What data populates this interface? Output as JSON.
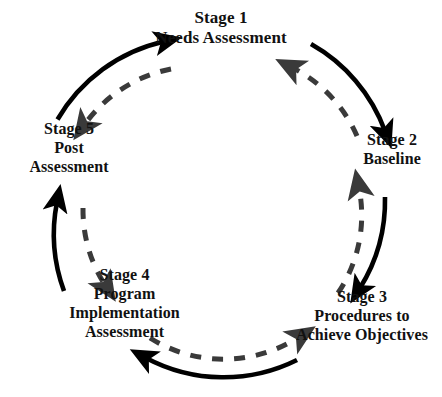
{
  "diagram": {
    "type": "circular-cycle",
    "center": {
      "x": 221,
      "y": 200
    },
    "solid_radius": 165,
    "dashed_radius": 139,
    "colors": {
      "background": "#ffffff",
      "solid_arc": "#000000",
      "dashed_arc": "#3a3a3a",
      "text": "#111111"
    },
    "stages": [
      {
        "id": "stage-1",
        "number": "Stage 1",
        "lines": [
          "Stage 1",
          "Needs Assessment"
        ],
        "angle_deg": -90
      },
      {
        "id": "stage-2",
        "number": "Stage 2",
        "lines": [
          "Stage 2",
          "Baseline"
        ],
        "angle_deg": -18
      },
      {
        "id": "stage-3",
        "number": "Stage 3",
        "lines": [
          "Stage 3",
          "Procedures to",
          "Achieve Objectives"
        ],
        "angle_deg": 54
      },
      {
        "id": "stage-4",
        "number": "Stage 4",
        "lines": [
          "Stage 4",
          "Program",
          "Implementation",
          "Assessment"
        ],
        "angle_deg": 126
      },
      {
        "id": "stage-5",
        "number": "Stage 5",
        "lines": [
          "Stage 5",
          "Post",
          "Assessment"
        ],
        "angle_deg": 198
      }
    ],
    "solid_arrows": [
      {
        "id": "arrow-solid-5-to-1",
        "from": "stage-5",
        "to": "stage-1",
        "style": "solid",
        "direction": "clockwise"
      },
      {
        "id": "arrow-solid-1-to-2",
        "from": "stage-1",
        "to": "stage-2",
        "style": "solid",
        "direction": "clockwise"
      },
      {
        "id": "arrow-solid-2-to-3",
        "from": "stage-2",
        "to": "stage-3",
        "style": "solid",
        "direction": "clockwise"
      },
      {
        "id": "arrow-solid-3-to-4",
        "from": "stage-3",
        "to": "stage-4",
        "style": "solid",
        "direction": "clockwise"
      },
      {
        "id": "arrow-solid-4-to-5",
        "from": "stage-4",
        "to": "stage-5",
        "style": "solid",
        "direction": "clockwise"
      }
    ],
    "dashed_arrows": [
      {
        "id": "arrow-dashed-1-to-5",
        "from": "stage-1",
        "to": "stage-5",
        "style": "dashed",
        "direction": "counter-clockwise"
      },
      {
        "id": "arrow-dashed-2-to-1",
        "from": "stage-2",
        "to": "stage-1",
        "style": "dashed",
        "direction": "counter-clockwise"
      },
      {
        "id": "arrow-dashed-3-to-2",
        "from": "stage-3",
        "to": "stage-2",
        "style": "dashed",
        "direction": "counter-clockwise"
      },
      {
        "id": "arrow-dashed-4-to-3",
        "from": "stage-4",
        "to": "stage-3",
        "style": "dashed",
        "direction": "counter-clockwise"
      },
      {
        "id": "arrow-dashed-5-to-4",
        "from": "stage-5",
        "to": "stage-4",
        "style": "dashed",
        "direction": "counter-clockwise"
      }
    ]
  }
}
